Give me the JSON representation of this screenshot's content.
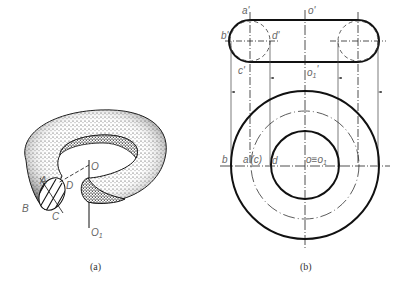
{
  "figure_a": {
    "caption": "(a)",
    "labels": {
      "A": "A",
      "B": "B",
      "C": "C",
      "D": "D",
      "O": "O",
      "O1": "O1"
    },
    "description": "Stippled 3D torus with hatched cross-section circle and vertical axis OO1"
  },
  "figure_b": {
    "caption": "(b)",
    "front_view_labels": {
      "a_prime": "a'",
      "o_prime": "o'",
      "b_prime": "b'",
      "d_prime": "d'",
      "c_prime": "c'",
      "o1_prime": "o1'"
    },
    "top_view_labels": {
      "b": "b",
      "a_c": "a'(c)",
      "d": "d",
      "o_o1": "o≡o1"
    },
    "description": "Orthographic projections of torus: front view (obround) and top view (concentric circles)"
  },
  "colors": {
    "line": "#111111",
    "label": "#666666",
    "thin": "#555555"
  }
}
